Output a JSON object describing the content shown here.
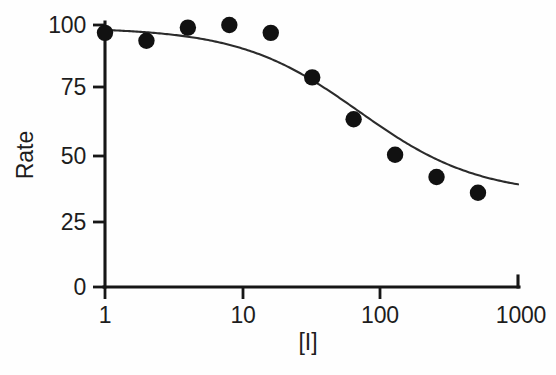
{
  "chart_data": {
    "type": "scatter",
    "title": "",
    "subtitle": "",
    "xlabel": "[I]",
    "ylabel": "Rate",
    "xscale": "log",
    "yscale": "linear",
    "xlim": [
      1,
      1000
    ],
    "ylim": [
      0,
      100
    ],
    "xticks": [
      1,
      10,
      100,
      1000
    ],
    "xtick_labels": [
      "1",
      "10",
      "100",
      "1000"
    ],
    "yticks": [
      0,
      25,
      50,
      75,
      100
    ],
    "ytick_labels": [
      "0",
      "25",
      "50",
      "75",
      "100"
    ],
    "grid": false,
    "legend": null,
    "annotations": [],
    "marker": "filled-circle",
    "marker_color": "#111111",
    "curve_color": "#2b2b2b",
    "series": [
      {
        "name": "Rate",
        "x": [
          1,
          2,
          4,
          8,
          16,
          32,
          64,
          128,
          256,
          512
        ],
        "y": [
          97,
          94,
          99,
          100,
          97,
          80,
          64,
          50.5,
          42,
          36
        ]
      }
    ],
    "fit": {
      "model": "four-parameter-logistic",
      "top": 99,
      "bottom": 35,
      "ic50": 70,
      "hill_slope": 1.0,
      "x_start": 1,
      "x_end": 1000
    }
  },
  "axes": {
    "y_title": "Rate",
    "x_title": "[I]",
    "x_tick_labels": [
      "1",
      "10",
      "100",
      "1000"
    ],
    "y_tick_labels": [
      "100",
      "75",
      "50",
      "25",
      "0"
    ]
  },
  "colors": {
    "ink": "#161616",
    "marker": "#111111",
    "curve": "#2b2b2b",
    "background": "#fefefe"
  }
}
